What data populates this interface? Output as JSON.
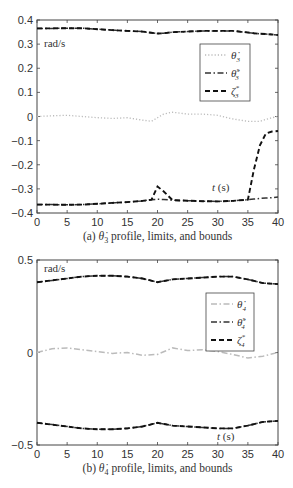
{
  "chart_data": [
    {
      "type": "line",
      "caption": "(a) θ̇3 profile, limits, and bounds",
      "caption_prefix": "(a)",
      "caption_symbol": "θ̇",
      "caption_sub": "3",
      "caption_suffix": "profile, limits, and bounds",
      "ylabel": "rad/s",
      "xlabel": "t (s)",
      "xlim": [
        0,
        40
      ],
      "ylim": [
        -0.4,
        0.4
      ],
      "xticks": [
        0,
        5,
        10,
        15,
        20,
        25,
        30,
        35,
        40
      ],
      "yticks": [
        0.4,
        0.3,
        0.2,
        0.1,
        0,
        -0.1,
        -0.2,
        -0.3,
        -0.4
      ],
      "ytick_labels": [
        "0.4",
        "0.3",
        "0.2",
        "0.1",
        "0",
        "−0.1",
        "−0.2",
        "−0.3",
        "−0.4"
      ],
      "grid": false,
      "legend_position": "upper right",
      "x": [
        0,
        2.5,
        5,
        7.5,
        10,
        12.5,
        15,
        17.5,
        19,
        20,
        21,
        22.5,
        25,
        27.5,
        30,
        32.5,
        35,
        36,
        37,
        38,
        39,
        40
      ],
      "series": [
        {
          "name": "θ̇3",
          "legend": "θ̇",
          "sub": "3",
          "sup": "",
          "style": "dotted",
          "color": "#bbbbbb",
          "values": [
            0,
            0.003,
            0.005,
            0,
            -0.005,
            -0.008,
            -0.005,
            -0.015,
            -0.02,
            -0.005,
            0.01,
            0.018,
            0.01,
            0.01,
            0.005,
            -0.01,
            -0.02,
            -0.02,
            -0.02,
            -0.012,
            -0.005,
            0
          ]
        },
        {
          "name": "θ̇3^s upper",
          "legend": "θ̇",
          "sub": "3",
          "sup": "s",
          "style": "dashdot",
          "color": "#333333",
          "values": [
            0.365,
            0.365,
            0.366,
            0.366,
            0.362,
            0.358,
            0.355,
            0.352,
            0.347,
            0.344,
            0.345,
            0.35,
            0.352,
            0.355,
            0.355,
            0.355,
            0.348,
            0.345,
            0.343,
            0.342,
            0.34,
            0.338
          ]
        },
        {
          "name": "θ̇3^s lower",
          "legend": "",
          "sub": "",
          "sup": "",
          "style": "dashdot",
          "color": "#333333",
          "values": [
            -0.365,
            -0.365,
            -0.366,
            -0.365,
            -0.362,
            -0.358,
            -0.355,
            -0.35,
            -0.345,
            -0.343,
            -0.344,
            -0.347,
            -0.349,
            -0.351,
            -0.352,
            -0.35,
            -0.345,
            -0.342,
            -0.34,
            -0.338,
            -0.336,
            -0.334
          ]
        },
        {
          "name": "ζ3* upper",
          "legend": "ζ",
          "sub": "3",
          "sup": "*",
          "style": "dashed",
          "color": "#111111",
          "values": [
            0.365,
            0.365,
            0.366,
            0.366,
            0.362,
            0.358,
            0.355,
            0.352,
            0.347,
            0.344,
            0.345,
            0.35,
            0.352,
            0.355,
            0.355,
            0.355,
            0.348,
            0.345,
            0.343,
            0.342,
            0.34,
            0.338
          ]
        },
        {
          "name": "ζ3* lower",
          "legend": "",
          "sub": "",
          "sup": "",
          "style": "dashed",
          "color": "#111111",
          "values": [
            -0.365,
            -0.365,
            -0.366,
            -0.365,
            -0.362,
            -0.358,
            -0.355,
            -0.35,
            -0.345,
            -0.29,
            -0.31,
            -0.347,
            -0.349,
            -0.351,
            -0.352,
            -0.35,
            -0.345,
            -0.22,
            -0.12,
            -0.07,
            -0.062,
            -0.06
          ]
        }
      ]
    },
    {
      "type": "line",
      "caption": "(b) θ̇4 profile, limits, and bounds",
      "caption_prefix": "(b)",
      "caption_symbol": "θ̇",
      "caption_sub": "4",
      "caption_suffix": "profile, limits, and bounds",
      "ylabel": "rad/s",
      "xlabel": "t (s)",
      "xlim": [
        0,
        40
      ],
      "ylim": [
        -0.5,
        0.5
      ],
      "xticks": [
        0,
        5,
        10,
        15,
        20,
        25,
        30,
        35,
        40
      ],
      "yticks": [
        0.5,
        0,
        -0.5
      ],
      "ytick_labels": [
        "0.5",
        "0",
        "−0.5"
      ],
      "grid": false,
      "legend_position": "upper right",
      "x": [
        0,
        2.5,
        5,
        7.5,
        10,
        12.5,
        15,
        17.5,
        20,
        22.5,
        25,
        27.5,
        30,
        32.5,
        35,
        37.5,
        40
      ],
      "series": [
        {
          "name": "θ̇4",
          "legend": "θ̇",
          "sub": "4",
          "sup": "",
          "style": "dashdot",
          "color": "#bbbbbb",
          "values": [
            0,
            0.02,
            0.025,
            0.015,
            0.005,
            -0.005,
            0.0,
            -0.015,
            -0.01,
            0.025,
            0.01,
            0.015,
            0.005,
            -0.01,
            -0.03,
            -0.02,
            0
          ]
        },
        {
          "name": "θ̇4^s upper",
          "legend": "θ̇",
          "sub": "4",
          "sup": "s",
          "style": "dashdot",
          "color": "#333333",
          "values": [
            0.38,
            0.39,
            0.4,
            0.41,
            0.415,
            0.415,
            0.41,
            0.4,
            0.38,
            0.395,
            0.4,
            0.405,
            0.41,
            0.41,
            0.395,
            0.375,
            0.37
          ]
        },
        {
          "name": "θ̇4^s lower",
          "legend": "",
          "sub": "",
          "sup": "",
          "style": "dashdot",
          "color": "#333333",
          "values": [
            -0.38,
            -0.39,
            -0.4,
            -0.41,
            -0.415,
            -0.415,
            -0.41,
            -0.4,
            -0.38,
            -0.395,
            -0.4,
            -0.405,
            -0.41,
            -0.41,
            -0.395,
            -0.375,
            -0.37
          ]
        },
        {
          "name": "ζ4* upper",
          "legend": "ζ",
          "sub": "4",
          "sup": "*",
          "style": "dashed",
          "color": "#111111",
          "values": [
            0.38,
            0.39,
            0.4,
            0.41,
            0.415,
            0.415,
            0.41,
            0.4,
            0.38,
            0.395,
            0.4,
            0.405,
            0.41,
            0.41,
            0.395,
            0.375,
            0.37
          ]
        },
        {
          "name": "ζ4* lower",
          "legend": "",
          "sub": "",
          "sup": "",
          "style": "dashed",
          "color": "#111111",
          "values": [
            -0.38,
            -0.39,
            -0.4,
            -0.41,
            -0.415,
            -0.415,
            -0.41,
            -0.4,
            -0.38,
            -0.395,
            -0.4,
            -0.405,
            -0.41,
            -0.41,
            -0.395,
            -0.375,
            -0.37
          ]
        }
      ]
    }
  ],
  "panels": [
    {
      "ylabel": "rad/s",
      "xlabel_t": "t",
      "xlabel_unit": "(s)",
      "caption": "(a) θ̇₃ profile, limits, and bounds"
    },
    {
      "ylabel": "rad/s",
      "xlabel_t": "t",
      "xlabel_unit": "(s)",
      "caption": "(b) θ̇₄ profile, limits, and bounds"
    }
  ]
}
